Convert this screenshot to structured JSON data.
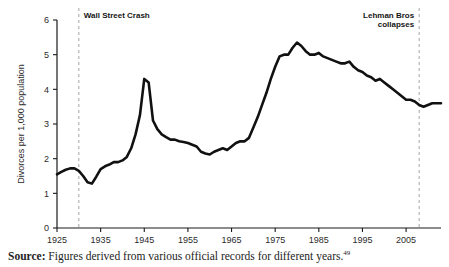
{
  "figure": {
    "source_label": "Source:",
    "source_text": " Figures derived from various official records for different years.",
    "footnote_marker": "49"
  },
  "chart_data": {
    "type": "line",
    "title": "",
    "xlabel": "",
    "ylabel": "Divorces per 1,000 population",
    "xlim": [
      1925,
      2013
    ],
    "ylim": [
      0,
      6
    ],
    "grid": false,
    "legend": null,
    "xticks": [
      1925,
      1935,
      1945,
      1955,
      1965,
      1975,
      1985,
      1995,
      2005
    ],
    "xtick_labels": [
      "1925",
      "1935",
      "1945",
      "1955",
      "1965",
      "1975",
      "1985",
      "1995",
      "2005"
    ],
    "yticks": [
      0,
      1,
      2,
      3,
      4,
      5,
      6
    ],
    "ytick_labels": [
      "0",
      "1",
      "2",
      "3",
      "4",
      "5",
      "6"
    ],
    "annotations": [
      {
        "label": "Wall Street Crash",
        "x": 1930,
        "align": "left",
        "lines": [
          "Wall Street Crash"
        ]
      },
      {
        "label": "Lehman Bros collapses",
        "x": 2008,
        "align": "right",
        "lines": [
          "Lehman Bros",
          "collapses"
        ]
      }
    ],
    "x": [
      1925,
      1926,
      1927,
      1928,
      1929,
      1930,
      1931,
      1932,
      1933,
      1934,
      1935,
      1936,
      1937,
      1938,
      1939,
      1940,
      1941,
      1942,
      1943,
      1944,
      1945,
      1946,
      1947,
      1948,
      1949,
      1950,
      1951,
      1952,
      1953,
      1954,
      1955,
      1956,
      1957,
      1958,
      1959,
      1960,
      1961,
      1962,
      1963,
      1964,
      1965,
      1966,
      1967,
      1968,
      1969,
      1970,
      1971,
      1972,
      1973,
      1974,
      1975,
      1976,
      1977,
      1978,
      1979,
      1980,
      1981,
      1982,
      1983,
      1984,
      1985,
      1986,
      1987,
      1988,
      1989,
      1990,
      1991,
      1992,
      1993,
      1994,
      1995,
      1996,
      1997,
      1998,
      1999,
      2000,
      2001,
      2002,
      2003,
      2004,
      2005,
      2006,
      2007,
      2008,
      2009,
      2010,
      2011,
      2012,
      2013
    ],
    "values": [
      1.55,
      1.62,
      1.68,
      1.72,
      1.72,
      1.65,
      1.5,
      1.32,
      1.28,
      1.48,
      1.7,
      1.78,
      1.83,
      1.9,
      1.9,
      1.95,
      2.05,
      2.3,
      2.7,
      3.25,
      4.3,
      4.2,
      3.1,
      2.85,
      2.7,
      2.62,
      2.55,
      2.55,
      2.5,
      2.48,
      2.45,
      2.4,
      2.35,
      2.2,
      2.15,
      2.12,
      2.2,
      2.25,
      2.3,
      2.25,
      2.35,
      2.45,
      2.5,
      2.5,
      2.6,
      2.9,
      3.2,
      3.55,
      3.9,
      4.3,
      4.65,
      4.95,
      5.0,
      5.0,
      5.2,
      5.35,
      5.25,
      5.1,
      5.0,
      5.0,
      5.05,
      4.95,
      4.9,
      4.85,
      4.8,
      4.75,
      4.75,
      4.8,
      4.65,
      4.55,
      4.5,
      4.4,
      4.35,
      4.25,
      4.3,
      4.2,
      4.1,
      4.0,
      3.9,
      3.8,
      3.7,
      3.7,
      3.65,
      3.55,
      3.5,
      3.55,
      3.6,
      3.6,
      3.6
    ]
  }
}
